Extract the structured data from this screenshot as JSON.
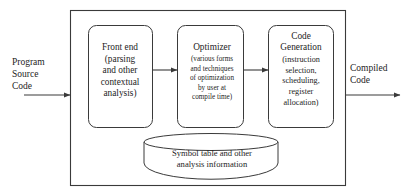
{
  "diagram": {
    "style": {
      "background": "#ffffff",
      "stroke": "#3a3a3a",
      "text": "#242424"
    },
    "input": {
      "label": "Program\nSource\nCode",
      "arrow": "right-arrow-icon"
    },
    "output": {
      "label": "Compiled\nCode",
      "arrow": "right-arrow-icon"
    },
    "outer_box": {
      "name": "compiler-boundary"
    },
    "stages": [
      {
        "id": "front-end",
        "title": "Front end",
        "body": "(parsing\nand other\ncontextual\nanalysis)"
      },
      {
        "id": "optimizer",
        "title": "Optimizer",
        "body": "(various forms\nand techniques\nof optimization\nby user at\ncompile time)"
      },
      {
        "id": "code-generation",
        "title": "Code\nGeneration",
        "body": "(instruction\nselection,\nscheduling,\nregister\nallocation)"
      }
    ],
    "connectors": [
      {
        "id": "front-end-to-optimizer",
        "icon": "right-arrow-icon"
      },
      {
        "id": "optimizer-to-code-generation",
        "icon": "right-arrow-icon"
      }
    ],
    "datastore": {
      "id": "symbol-table",
      "shape": "cylinder-icon",
      "label": "Symbol table and other\nanalysis information"
    }
  }
}
